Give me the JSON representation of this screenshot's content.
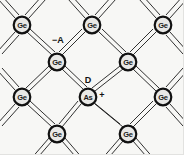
{
  "figure": {
    "background_color": "#f7f7f5",
    "line_color": "#1a1a1a",
    "atom_fill_color": "#e8e8e6",
    "atom_ring_color": "#111111",
    "width": 184,
    "height": 155
  },
  "lattice": {
    "bond_style": "double-line",
    "rows": [
      {
        "y": 25,
        "atoms": [
          {
            "x": 22,
            "label": "Ge"
          },
          {
            "x": 92,
            "label": "Ge"
          },
          {
            "x": 163,
            "label": "Ge"
          }
        ]
      },
      {
        "y": 62,
        "atoms": [
          {
            "x": 57,
            "label": "Ge"
          },
          {
            "x": 128,
            "label": "Ge"
          }
        ]
      },
      {
        "y": 97,
        "atoms": [
          {
            "x": 22,
            "label": "Ge"
          },
          {
            "x": 88,
            "label": "As"
          },
          {
            "x": 163,
            "label": "Ge"
          }
        ]
      },
      {
        "y": 134,
        "atoms": [
          {
            "x": 57,
            "label": "Ge"
          },
          {
            "x": 128,
            "label": "Ge"
          }
        ]
      }
    ],
    "atoms": [
      {
        "id": "ge-r1-c1",
        "label": "Ge",
        "x": 22,
        "y": 25,
        "element": "germanium"
      },
      {
        "id": "ge-r1-c2",
        "label": "Ge",
        "x": 92,
        "y": 25,
        "element": "germanium"
      },
      {
        "id": "ge-r1-c3",
        "label": "Ge",
        "x": 163,
        "y": 25,
        "element": "germanium"
      },
      {
        "id": "ge-r2-c1",
        "label": "Ge",
        "x": 57,
        "y": 62,
        "element": "germanium"
      },
      {
        "id": "ge-r2-c2",
        "label": "Ge",
        "x": 128,
        "y": 62,
        "element": "germanium"
      },
      {
        "id": "ge-r3-c1",
        "label": "Ge",
        "x": 22,
        "y": 97,
        "element": "germanium"
      },
      {
        "id": "as-r3-c2",
        "label": "As",
        "x": 88,
        "y": 97,
        "element": "arsenic"
      },
      {
        "id": "ge-r3-c3",
        "label": "Ge",
        "x": 163,
        "y": 97,
        "element": "germanium"
      },
      {
        "id": "ge-r4-c1",
        "label": "Ge",
        "x": 57,
        "y": 134,
        "element": "germanium"
      },
      {
        "id": "ge-r4-c2",
        "label": "Ge",
        "x": 128,
        "y": 134,
        "element": "germanium"
      }
    ]
  },
  "annotations": [
    {
      "id": "acceptor-label",
      "text": "−A",
      "x": 58,
      "y": 40
    },
    {
      "id": "donor-label",
      "text": "D",
      "x": 88,
      "y": 80
    },
    {
      "id": "plus-charge",
      "text": "+",
      "x": 102,
      "y": 95
    }
  ],
  "labels": {
    "germanium": "Ge",
    "arsenic": "As",
    "acceptor": "−A",
    "donor": "D",
    "positive_charge": "+"
  }
}
